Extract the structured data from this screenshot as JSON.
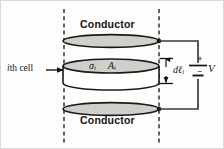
{
  "figure": {
    "title_text": "",
    "background_color": "#fdfdfd",
    "ink_color": "#15150f",
    "fill_color": "#cfcfcb",
    "dashed_guide_color": "#3b3b3b"
  },
  "labels": {
    "conductor_top": "Conductor",
    "conductor_bottom": "Conductor",
    "cell_pointer": "ith cell",
    "cell_pointer_italic_part": "i",
    "cell_pointer_roman_part": "th cell",
    "conductivity_symbol": "σ",
    "conductivity_subscript": "i",
    "area_symbol": "A",
    "area_subscript": "i",
    "length_symbol": "dℓ",
    "length_subscript": "i",
    "voltage_symbol": "V",
    "plus_sign_dimension": "+",
    "minus_sign_dimension": "+",
    "battery_plus": "+",
    "battery_minus": "−"
  },
  "diagram": {
    "type": "physics-circuit-schematic",
    "elements": [
      {
        "name": "top-conductor-plate",
        "shape": "ellipse",
        "cx": 110,
        "cy": 40,
        "rx": 48,
        "ry": 6.5
      },
      {
        "name": "cell-cylinder",
        "shape": "cylinder",
        "cx": 110,
        "cy_top": 65,
        "rx": 48,
        "ry": 7,
        "height": 17
      },
      {
        "name": "bottom-conductor-plate",
        "shape": "ellipse",
        "cx": 110,
        "cy": 108,
        "rx": 48,
        "ry": 6.5
      },
      {
        "name": "left-guide-line",
        "shape": "dashed-vertical",
        "x": 63,
        "y1": 8,
        "y2": 143
      },
      {
        "name": "right-guide-line",
        "shape": "dashed-vertical",
        "x": 158,
        "y1": 8,
        "y2": 143
      },
      {
        "name": "dimension-arrow",
        "shape": "double-arrow-vertical",
        "x": 164,
        "y1": 57,
        "y2": 82
      },
      {
        "name": "battery",
        "shape": "cell-symbol",
        "x": 197,
        "y": 69
      },
      {
        "name": "top-wire",
        "shape": "polyline",
        "points": "158,40 197,40 197,62"
      },
      {
        "name": "bottom-wire",
        "shape": "polyline",
        "points": "158,108 197,108 197,77"
      }
    ]
  }
}
